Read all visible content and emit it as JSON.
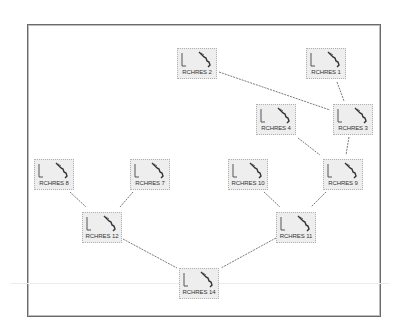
{
  "diagram": {
    "title": "",
    "frame": {
      "x": 27,
      "y": 24,
      "w": 352,
      "h": 291
    },
    "nodes": [
      {
        "id": "r2",
        "label": "RCHRES 2",
        "x": 177,
        "y": 48
      },
      {
        "id": "r1",
        "label": "RCHRES 1",
        "x": 306,
        "y": 48
      },
      {
        "id": "r4",
        "label": "RCHRES 4",
        "x": 256,
        "y": 104
      },
      {
        "id": "r3",
        "label": "RCHRES 3",
        "x": 333,
        "y": 104
      },
      {
        "id": "r8",
        "label": "RCHRES 8",
        "x": 34,
        "y": 159
      },
      {
        "id": "r7",
        "label": "RCHRES 7",
        "x": 130,
        "y": 159
      },
      {
        "id": "r10",
        "label": "RCHRES 10",
        "x": 228,
        "y": 159
      },
      {
        "id": "r9",
        "label": "RCHRES 9",
        "x": 323,
        "y": 159
      },
      {
        "id": "r12",
        "label": "RCHRES 12",
        "x": 82,
        "y": 212
      },
      {
        "id": "r11",
        "label": "RCHRES 11",
        "x": 276,
        "y": 212
      },
      {
        "id": "r14",
        "label": "RCHRES 14",
        "x": 179,
        "y": 268
      }
    ],
    "edges": [
      {
        "from": "RCHRES 2",
        "to": "RCHRES 3",
        "x1": 219,
        "y1": 72,
        "x2": 330,
        "y2": 110
      },
      {
        "from": "RCHRES 1",
        "to": "RCHRES 3",
        "x1": 337,
        "y1": 82,
        "x2": 344,
        "y2": 101
      },
      {
        "from": "RCHRES 4",
        "to": "RCHRES 9",
        "x1": 298,
        "y1": 138,
        "x2": 320,
        "y2": 155
      },
      {
        "from": "RCHRES 3",
        "to": "RCHRES 9",
        "x1": 349,
        "y1": 137,
        "x2": 346,
        "y2": 155
      },
      {
        "from": "RCHRES 8",
        "to": "RCHRES 12",
        "x1": 70,
        "y1": 192,
        "x2": 86,
        "y2": 207
      },
      {
        "from": "RCHRES 7",
        "to": "RCHRES 12",
        "x1": 133,
        "y1": 192,
        "x2": 120,
        "y2": 207
      },
      {
        "from": "RCHRES 10",
        "to": "RCHRES 11",
        "x1": 264,
        "y1": 192,
        "x2": 280,
        "y2": 207
      },
      {
        "from": "RCHRES 9",
        "to": "RCHRES 11",
        "x1": 326,
        "y1": 192,
        "x2": 311,
        "y2": 207
      },
      {
        "from": "RCHRES 12",
        "to": "RCHRES 14",
        "x1": 123,
        "y1": 239,
        "x2": 177,
        "y2": 268
      },
      {
        "from": "RCHRES 11",
        "to": "RCHRES 14",
        "x1": 276,
        "y1": 238,
        "x2": 221,
        "y2": 268
      }
    ],
    "colors": {
      "node_fill": "#eeeeee",
      "edge": "#7a7a7a",
      "frame": "#6a6a6a",
      "label": "#333333"
    },
    "icon": "river-reach-icon"
  }
}
